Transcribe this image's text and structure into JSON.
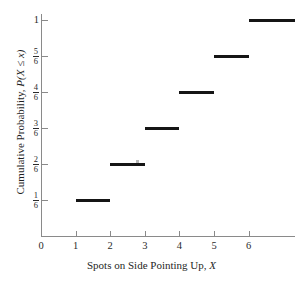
{
  "chart_data": {
    "type": "line",
    "title": "",
    "subtitle": "",
    "xlabel_parts": {
      "text": "Spots on Side Pointing Up, ",
      "variable": "X"
    },
    "xlabel": "Spots on Side Pointing Up, X",
    "ylabel_parts": {
      "text": "Cumulative Probability, ",
      "variable": "P(X ≤ x)"
    },
    "ylabel": "Cumulative Probability, P(X ≤ x)",
    "grid": false,
    "legend": "none",
    "xlim": [
      0,
      7.34
    ],
    "ylim": [
      0,
      1.166
    ],
    "x_ticks": [
      {
        "value": 0,
        "label": "0"
      },
      {
        "value": 1,
        "label": "1"
      },
      {
        "value": 2,
        "label": "2"
      },
      {
        "value": 3,
        "label": "3"
      },
      {
        "value": 4,
        "label": "4"
      },
      {
        "value": 5,
        "label": "5"
      },
      {
        "value": 6,
        "label": "6"
      }
    ],
    "y_ticks": [
      {
        "value": 0.16667,
        "label": "1/6",
        "numerator": "1",
        "denominator": "6",
        "whole": null
      },
      {
        "value": 0.33333,
        "label": "2/6",
        "numerator": "2",
        "denominator": "6",
        "whole": null
      },
      {
        "value": 0.5,
        "label": "3/6",
        "numerator": "3",
        "denominator": "6",
        "whole": null
      },
      {
        "value": 0.66667,
        "label": "4/6",
        "numerator": "4",
        "denominator": "6",
        "whole": null
      },
      {
        "value": 0.83333,
        "label": "5/6",
        "numerator": "5",
        "denominator": "6",
        "whole": null
      },
      {
        "value": 1.0,
        "label": "1",
        "numerator": null,
        "denominator": null,
        "whole": "1"
      }
    ],
    "series": [
      {
        "name": "Cumulative Probability",
        "style": "step",
        "color": "#151515",
        "steps": [
          {
            "x_start": 1,
            "x_end": 2,
            "y": 0.16667,
            "y_label": "1/6"
          },
          {
            "x_start": 2,
            "x_end": 3,
            "y": 0.33333,
            "y_label": "2/6"
          },
          {
            "x_start": 3,
            "x_end": 4,
            "y": 0.5,
            "y_label": "3/6"
          },
          {
            "x_start": 4,
            "x_end": 5,
            "y": 0.66667,
            "y_label": "4/6"
          },
          {
            "x_start": 5,
            "x_end": 6,
            "y": 0.83333,
            "y_label": "5/6"
          },
          {
            "x_start": 6,
            "x_end": 7.34,
            "y": 1.0,
            "y_label": "1"
          }
        ],
        "x": [
          1,
          2,
          3,
          4,
          5,
          6
        ],
        "values": [
          0.16667,
          0.33333,
          0.5,
          0.66667,
          0.83333,
          1.0
        ]
      }
    ],
    "annotations": [],
    "colors": {
      "step_line": "#151515",
      "axis": "#8a8a8a",
      "text": "#1f1f1f",
      "background": "#ffffff"
    }
  }
}
